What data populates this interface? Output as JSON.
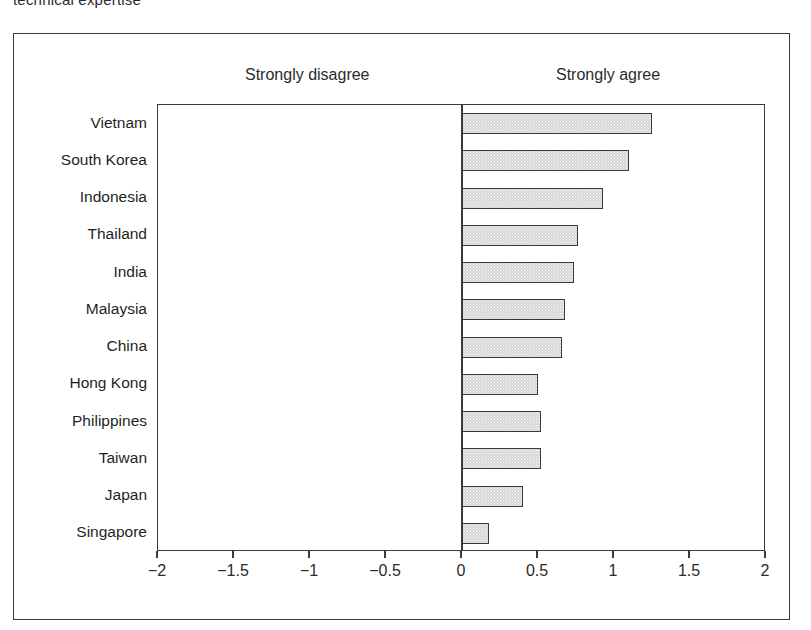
{
  "caption_fragment": "technical expertise",
  "header": {
    "left_label": "Strongly disagree",
    "right_label": "Strongly agree"
  },
  "chart_data": {
    "type": "bar",
    "orientation": "horizontal",
    "title": "",
    "subtitle": "",
    "xlabel": "",
    "ylabel": "",
    "xlim": [
      -2,
      2
    ],
    "xticks": [
      -2,
      -1.5,
      -1,
      -0.5,
      0,
      0.5,
      1,
      1.5,
      2
    ],
    "xticklabels": [
      "-2",
      "-1.5",
      "-1",
      "-0.5",
      "0",
      "0.5",
      "1",
      "1.5",
      "2"
    ],
    "grid": false,
    "legend": false,
    "zero_line": 0,
    "annotations": [
      "Strongly disagree",
      "Strongly agree"
    ],
    "bar_fill_color": "#d6d6d6",
    "bar_edge_color": "#3a3a3a",
    "categories": [
      "Vietnam",
      "South Korea",
      "Indonesia",
      "Thailand",
      "India",
      "Malaysia",
      "China",
      "Hong Kong",
      "Philippines",
      "Taiwan",
      "Japan",
      "Singapore"
    ],
    "values": [
      1.25,
      1.1,
      0.93,
      0.76,
      0.74,
      0.68,
      0.66,
      0.5,
      0.52,
      0.52,
      0.4,
      0.18
    ]
  }
}
